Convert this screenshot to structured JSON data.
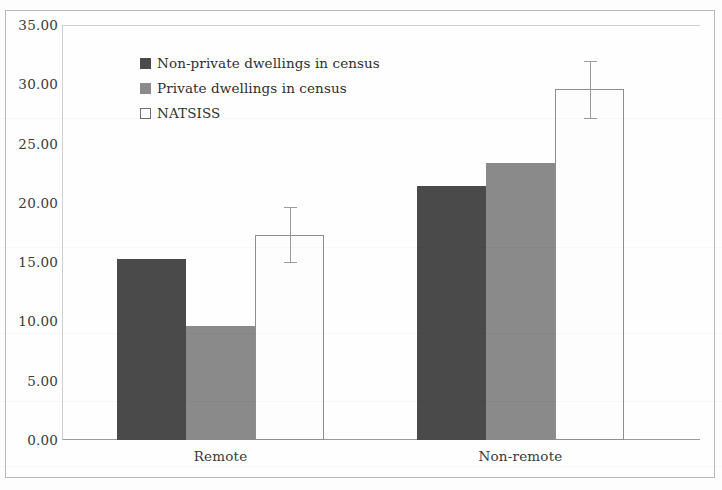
{
  "chart_data": {
    "type": "bar",
    "title": "",
    "subtitle": "",
    "xlabel": "",
    "ylabel": "",
    "categories": [
      "Remote",
      "Non-remote"
    ],
    "series": [
      {
        "name": "Non-private dwellings in census",
        "color": "#4a4a4a",
        "values": [
          15.3,
          21.4
        ]
      },
      {
        "name": "Private dwellings in census",
        "color": "#8a8a8a",
        "values": [
          9.6,
          23.4
        ]
      },
      {
        "name": "NATSISS",
        "color": "#ffffff",
        "values": [
          17.3,
          29.6
        ],
        "error_low": [
          14.9,
          27.1
        ],
        "error_high": [
          19.6,
          31.9
        ]
      }
    ],
    "ylim": [
      0,
      35
    ],
    "ytick_step": 5,
    "ytick_labels": [
      "0.00",
      "5.00",
      "10.00",
      "15.00",
      "20.00",
      "25.00",
      "30.00",
      "35.00"
    ],
    "ytick_values": [
      0,
      5,
      10,
      15,
      20,
      25,
      30,
      35
    ],
    "grid": false,
    "legend_position": "inside-top-left",
    "has_error_bars": true
  },
  "legend": {
    "entries": [
      {
        "label": "Non-private dwellings in census"
      },
      {
        "label": "Private dwellings in census"
      },
      {
        "label": "NATSISS"
      }
    ]
  }
}
